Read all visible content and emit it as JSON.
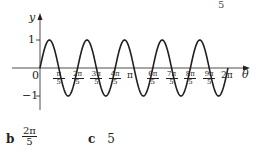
{
  "corner_fragment": "5",
  "chart_data": {
    "type": "line",
    "title": "",
    "function": "y = sin(5θ)",
    "xlabel": "θ",
    "ylabel": "y",
    "xlim": [
      0,
      6.2832
    ],
    "ylim": [
      -1,
      1
    ],
    "grid": false,
    "legend": null,
    "y_ticks": [
      {
        "value": 1,
        "label": "1"
      },
      {
        "value": -1,
        "label": "−1"
      }
    ],
    "origin_label": "0",
    "x_ticks": [
      {
        "num": "π",
        "den": "5"
      },
      {
        "num": "2π",
        "den": "5"
      },
      {
        "num": "3π",
        "den": "5"
      },
      {
        "num": "4π",
        "den": "5"
      },
      {
        "num": "π",
        "den": ""
      },
      {
        "num": "6π",
        "den": "5"
      },
      {
        "num": "7π",
        "den": "5"
      },
      {
        "num": "8π",
        "den": "5"
      },
      {
        "num": "9π",
        "den": "5"
      },
      {
        "num": "2π",
        "den": ""
      }
    ],
    "series": [
      {
        "name": "sin 5θ",
        "period": "2π/5",
        "cycles": 5,
        "amplitude": 1
      }
    ]
  },
  "answers": [
    {
      "label": "b",
      "num": "2π",
      "den": "5"
    },
    {
      "label": "c",
      "value": "5"
    }
  ]
}
